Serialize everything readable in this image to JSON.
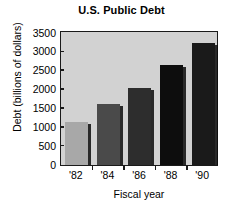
{
  "chart_data": {
    "type": "bar",
    "title": "U.S. Public Debt",
    "xlabel": "Fiscal year",
    "ylabel": "Debt (billions of dollars)",
    "categories": [
      "'82",
      "'84",
      "'86",
      "'88",
      "'90"
    ],
    "values": [
      1150,
      1620,
      2050,
      2650,
      3230
    ],
    "ylim": [
      0,
      3500
    ],
    "yticks": [
      0,
      500,
      1000,
      1500,
      2000,
      2500,
      3000,
      3500
    ],
    "ytick_labels": [
      "0",
      "500",
      "1000",
      "1500",
      "2000",
      "2500",
      "3000",
      "3500"
    ],
    "grid": false,
    "legend": false,
    "bar_colors": [
      "#a8a8a8",
      "#4a4a4a",
      "#2d2d2d",
      "#0d0d0d",
      "#1a1a1a"
    ],
    "plot_background": "#d2d2d2",
    "axis_color": "#1a1a1a",
    "figure_background": "#ffffff"
  }
}
